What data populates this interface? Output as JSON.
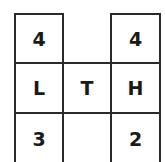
{
  "puzzle": {
    "grid": [
      [
        {
          "label": "4"
        },
        null,
        {
          "label": "4"
        }
      ],
      [
        {
          "label": "L"
        },
        {
          "label": "T"
        },
        {
          "label": "H"
        }
      ],
      [
        {
          "label": "3"
        },
        {
          "label": ""
        },
        {
          "label": "2"
        }
      ]
    ],
    "cells": {
      "r0c0": "4",
      "r0c2": "4",
      "r1c0": "L",
      "r1c1": "T",
      "r1c2": "H",
      "r2c0": "3",
      "r2c1": "",
      "r2c2": "2"
    },
    "colors": {
      "border": "#2a2a2a",
      "text": "#1a1a1a",
      "background": "#ffffff"
    }
  }
}
